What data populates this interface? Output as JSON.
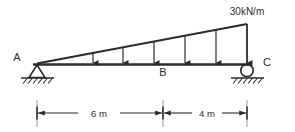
{
  "diagram": {
    "type": "beam-free-body-diagram",
    "colors": {
      "line": "#2b2b2b",
      "background": "#ffffff",
      "text": "#2b2b2b"
    },
    "load": {
      "label": "30kN/m",
      "shape": "triangular",
      "min_value": 0,
      "max_value": 30,
      "unit": "kN/m",
      "peak_at": "C",
      "zero_at": "A",
      "arrow_count": 6,
      "direction": "downward"
    },
    "nodes": [
      {
        "id": "A",
        "label": "A",
        "support": "pin",
        "position": "left-end"
      },
      {
        "id": "B",
        "label": "B",
        "support": "none",
        "position": "interior"
      },
      {
        "id": "C",
        "label": "C",
        "support": "roller",
        "position": "right-end"
      }
    ],
    "dimensions": [
      {
        "label": "6 m",
        "from": "A",
        "to": "B",
        "value": 6,
        "unit": "m"
      },
      {
        "label": "4 m",
        "from": "B",
        "to": "C",
        "value": 4,
        "unit": "m"
      }
    ]
  }
}
